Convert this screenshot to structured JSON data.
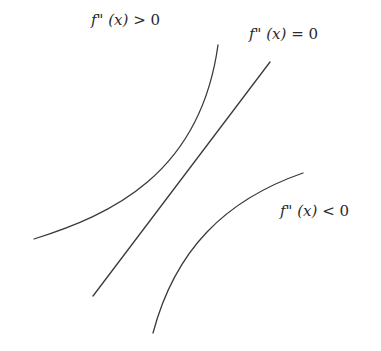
{
  "diagram": {
    "title": "",
    "labels": {
      "positive": {
        "f": "f",
        "primes": "\"",
        "arg": "(x)",
        "rel": "> 0"
      },
      "zero": {
        "f": "f",
        "primes": "\"",
        "arg": "(x)",
        "rel": "= 0"
      },
      "negative": {
        "f": "f",
        "primes": "\"",
        "arg": "(x)",
        "rel": "< 0"
      }
    },
    "curves": [
      {
        "id": "convex",
        "label": "f\" (x) > 0",
        "shape": "concave-up curve",
        "start": [
          34,
          239
        ],
        "end": [
          218,
          45
        ]
      },
      {
        "id": "linear",
        "label": "f\" (x) = 0",
        "shape": "straight line",
        "start": [
          93,
          296
        ],
        "end": [
          270,
          62
        ]
      },
      {
        "id": "concave",
        "label": "f\" (x) < 0",
        "shape": "concave-down curve",
        "start": [
          153,
          333
        ],
        "end": [
          303,
          173
        ]
      }
    ],
    "stroke_color": "#3a3a3a",
    "background": "#ffffff"
  }
}
